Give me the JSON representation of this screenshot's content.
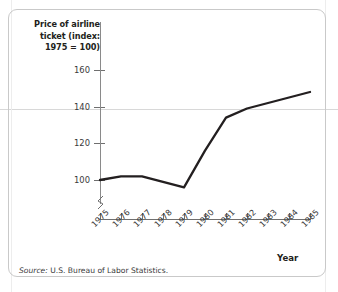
{
  "chart_data": {
    "type": "line",
    "title": "Price of airline ticket (index: 1975 = 100)",
    "title_lines": [
      "Price of airline",
      "ticket (index:",
      "1975 = 100)"
    ],
    "xlabel": "Year",
    "ylabel": "Price of airline ticket (index: 1975 = 100)",
    "source": "Source: U.S. Bureau of Labor Statistics.",
    "source_prefix": "Source:",
    "source_text": "U.S. Bureau of Labor Statistics.",
    "categories": [
      1975,
      1976,
      1977,
      1978,
      1979,
      1980,
      1981,
      1982,
      1983,
      1984,
      1985
    ],
    "x_tick_labels": [
      "1975",
      "1976",
      "1977",
      "1978",
      "1979",
      "1980",
      "1981",
      "1982",
      "1983",
      "1984",
      "1985"
    ],
    "values": [
      100,
      102,
      102,
      99,
      96,
      116,
      134,
      139,
      142,
      145,
      148
    ],
    "y_tick_labels": [
      "100",
      "120",
      "140",
      "160"
    ],
    "y_ticks": [
      100,
      120,
      140,
      160
    ],
    "ylim": [
      90,
      168
    ],
    "xlim": [
      1975,
      1985
    ],
    "axis_break": true,
    "grid": false,
    "legend": null,
    "line_color": "#231f20",
    "axis_color": "#6f6f6f",
    "series": [
      {
        "name": "Price of airline ticket",
        "values": [
          100,
          102,
          102,
          99,
          96,
          116,
          134,
          139,
          142,
          145,
          148
        ]
      }
    ]
  },
  "figure": {
    "border_color": "#c9c9c9",
    "background": "#ffffff"
  }
}
